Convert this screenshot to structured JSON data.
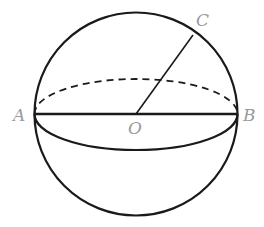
{
  "diagram": {
    "type": "sphere",
    "colors": {
      "stroke": "#1a1a1a",
      "label": "#9a9a9a",
      "background": "#ffffff"
    },
    "points": [
      {
        "id": "A",
        "label": "A",
        "x": 34,
        "y": 114
      },
      {
        "id": "B",
        "label": "B",
        "x": 237,
        "y": 114
      },
      {
        "id": "O",
        "label": "O",
        "x": 136,
        "y": 114
      },
      {
        "id": "C",
        "label": "C",
        "x": 193,
        "y": 35
      }
    ],
    "segments": [
      {
        "from": "A",
        "to": "B",
        "style": "solid"
      },
      {
        "from": "O",
        "to": "C",
        "style": "solid"
      }
    ],
    "labels": {
      "A": "A",
      "B": "B",
      "O": "O",
      "C": "C"
    }
  }
}
